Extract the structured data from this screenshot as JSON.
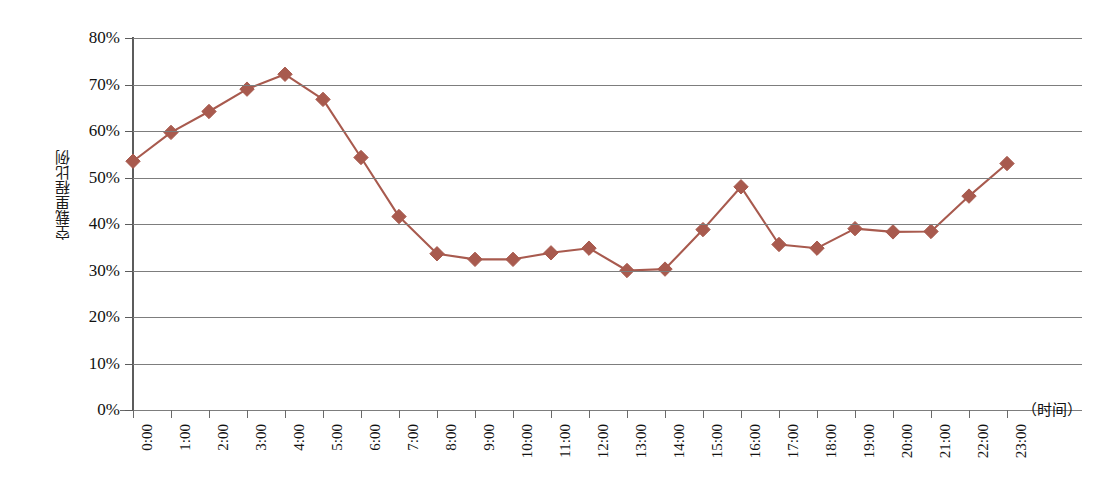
{
  "chart_data": {
    "type": "line",
    "title": "",
    "xlabel": "（时间）",
    "ylabel": "空载里程比例",
    "categories": [
      "0:00",
      "1:00",
      "2:00",
      "3:00",
      "4:00",
      "5:00",
      "6:00",
      "7:00",
      "8:00",
      "9:00",
      "10:00",
      "11:00",
      "12:00",
      "13:00",
      "14:00",
      "15:00",
      "16:00",
      "17:00",
      "18:00",
      "19:00",
      "20:00",
      "21:00",
      "22:00",
      "23:00"
    ],
    "values": [
      53.5,
      59.7,
      64.2,
      69.0,
      72.2,
      66.8,
      54.3,
      41.6,
      33.6,
      32.4,
      32.4,
      33.8,
      34.8,
      30.0,
      30.3,
      38.8,
      48.0,
      35.6,
      34.8,
      39.0,
      38.3,
      38.4,
      46.0,
      53.0
    ],
    "series": [
      {
        "name": "空载里程比例",
        "color": "#a85a4e",
        "marker": "diamond",
        "values": [
          53.5,
          59.7,
          64.2,
          69.0,
          72.2,
          66.8,
          54.3,
          41.6,
          33.6,
          32.4,
          32.4,
          33.8,
          34.8,
          30.0,
          30.3,
          38.8,
          48.0,
          35.6,
          34.8,
          39.0,
          38.3,
          38.4,
          46.0,
          53.0
        ]
      }
    ],
    "y_ticks": [
      "0%",
      "10%",
      "20%",
      "30%",
      "40%",
      "50%",
      "60%",
      "70%",
      "80%"
    ],
    "y_tick_values": [
      0,
      10,
      20,
      30,
      40,
      50,
      60,
      70,
      80
    ],
    "ylim": [
      0,
      80
    ],
    "grid": true,
    "legend": "none",
    "gridline_color": "#7d7d7d",
    "axis_color": "#5c5c5c",
    "background": "#ffffff"
  }
}
